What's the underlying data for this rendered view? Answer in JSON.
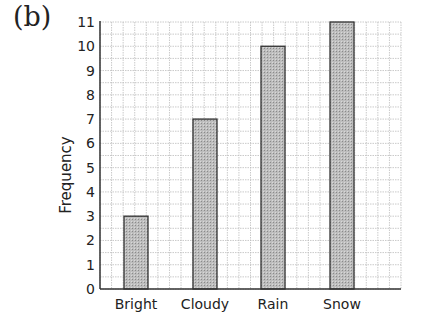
{
  "panel_label": "(b)",
  "chart_data": {
    "type": "bar",
    "title": "",
    "xlabel": "",
    "ylabel": "Frequency",
    "categories": [
      "Bright",
      "Cloudy",
      "Rain",
      "Snow"
    ],
    "values": [
      3,
      7,
      10,
      11
    ],
    "ylim": [
      0,
      11
    ],
    "yticks": [
      0,
      1,
      2,
      3,
      4,
      5,
      6,
      7,
      8,
      9,
      10,
      11
    ],
    "grid": true,
    "legend": null,
    "bar_color": "#b8b8b8",
    "bar_edge_color": "#333333",
    "grid_color": "#bdbdbd"
  }
}
